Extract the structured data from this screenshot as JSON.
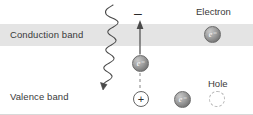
{
  "figure": {
    "bands": {
      "conduction": {
        "label": "Conduction band",
        "fill": "#e4e4e4"
      },
      "valence": {
        "label": "Valence band",
        "fill": "#ffffff"
      }
    },
    "captions": {
      "electron": "Electron",
      "hole": "Hole"
    },
    "signs": {
      "negative": "–",
      "positive": "+"
    },
    "particles": {
      "electron_symbol": "e⁻",
      "conduction_electron": "e⁻",
      "moving_electron": "e⁻",
      "valence_electron": "e⁻"
    },
    "colors": {
      "band_gray": "#e4e4e4",
      "particle_dark": "#6e6e6e",
      "particle_light": "#c9c9c9",
      "text": "#3a3a3a",
      "stroke": "#4a4a4a",
      "hole_outline": "#b6b6b6"
    },
    "annotations": {
      "photon": "wavy-photon-arrow",
      "transition": "upward-excitation-arrow",
      "trajectory": "dashed-vertical-line"
    }
  }
}
